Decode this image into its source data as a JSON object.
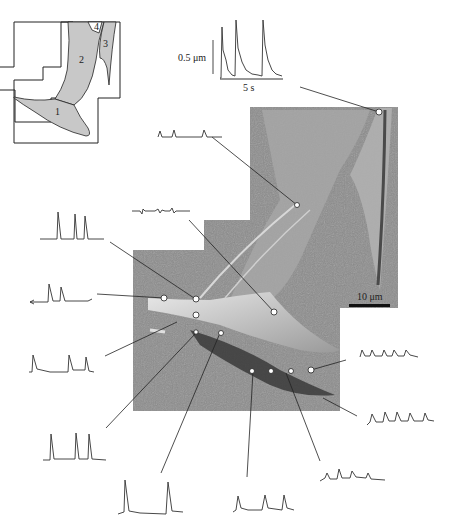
{
  "figure": {
    "schematic": {
      "regions": [
        {
          "id": "1",
          "label": "1"
        },
        {
          "id": "2",
          "label": "2"
        },
        {
          "id": "3",
          "label": "3"
        },
        {
          "id": "4",
          "label": "4"
        }
      ]
    },
    "inset_trace": {
      "amplitude_scale": "0.5 μm",
      "time_scale": "5 s",
      "peaks": 3
    },
    "micrograph": {
      "scale_bar": "10 μm"
    },
    "traces": [
      {
        "id": "t-top-right-inset",
        "peaks": 3,
        "description": "large oscillations, region 3 tip"
      },
      {
        "id": "t-upper",
        "peaks": 3,
        "description": "small oscillations, upper lamella"
      },
      {
        "id": "t-flat",
        "peaks": 0,
        "description": "noise trace, no oscillation"
      },
      {
        "id": "t-left-1",
        "peaks": 3
      },
      {
        "id": "t-left-2",
        "peaks": 2
      },
      {
        "id": "t-left-3",
        "peaks": 3
      },
      {
        "id": "t-bottom-1",
        "peaks": 3
      },
      {
        "id": "t-bottom-2",
        "peaks": 2
      },
      {
        "id": "t-bottom-3",
        "peaks": 3
      },
      {
        "id": "t-bottom-4",
        "peaks": 4
      },
      {
        "id": "t-right-1",
        "peaks": 5
      },
      {
        "id": "t-right-2",
        "peaks": 5
      }
    ],
    "colors": {
      "line": "#222222",
      "schematic_fill": "#c8c8c8",
      "micrograph_bg": "#8a8a8a"
    }
  }
}
